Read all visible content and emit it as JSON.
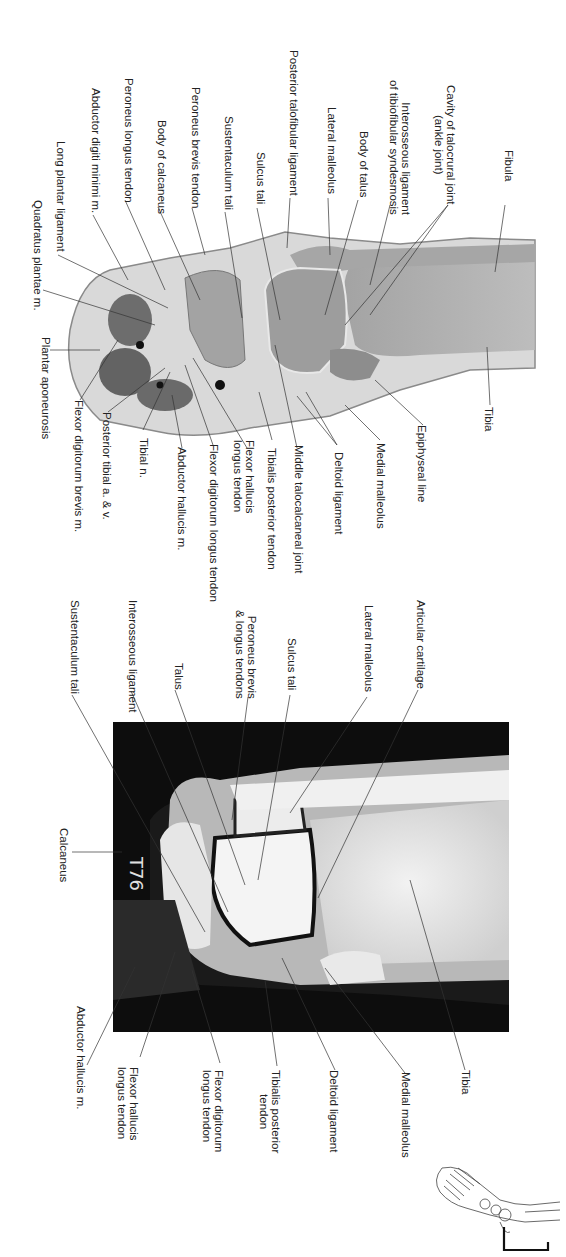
{
  "page": {
    "orientation": "rotated-90",
    "figures": [
      {
        "id": "cadaver-section",
        "type": "coronal anatomical section (ankle)",
        "labels": [
          {
            "text": "Fibula"
          },
          {
            "text": "Cavity of talocrural joint\n(ankle joint)"
          },
          {
            "text": "Interosseous ligament\nof tibiofibular syndesmosis"
          },
          {
            "text": "Body of talus"
          },
          {
            "text": "Lateral malleolus"
          },
          {
            "text": "Posterior talofibular ligament"
          },
          {
            "text": "Sulcus tali"
          },
          {
            "text": "Sustentaculum tali"
          },
          {
            "text": "Peroneus brevis tendon"
          },
          {
            "text": "Body of calcaneus"
          },
          {
            "text": "Peroneus longus tendon"
          },
          {
            "text": "Abductor digiti minimi m."
          },
          {
            "text": "Long plantar ligament"
          },
          {
            "text": "Quadratus plantae m."
          },
          {
            "text": "Plantar aponeurosis"
          },
          {
            "text": "Flexor digitorum brevis m."
          },
          {
            "text": "Posterior tibial a. & v."
          },
          {
            "text": "Tibial n."
          },
          {
            "text": "Abductor hallucis m."
          },
          {
            "text": "Flexor digitorum longus tendon"
          },
          {
            "text": "Flexor hallucis\nlongus tendon"
          },
          {
            "text": "Tibialis posterior tendon"
          },
          {
            "text": "Middle talocalcaneal joint"
          },
          {
            "text": "Deltoid ligament"
          },
          {
            "text": "Medial malleolus"
          },
          {
            "text": "Epiphyseal line"
          },
          {
            "text": "Tibia"
          }
        ]
      },
      {
        "id": "mri-section",
        "type": "coronal MRI (ankle)",
        "overlay_text": "T76",
        "labels": [
          {
            "text": "Articular cartilage"
          },
          {
            "text": "Lateral malleolus"
          },
          {
            "text": "Sulcus tali"
          },
          {
            "text": "Peroneus brevis\n& longus tendons"
          },
          {
            "text": "Talus"
          },
          {
            "text": "Interosseous ligament"
          },
          {
            "text": "Sustentaculum tali"
          },
          {
            "text": "Calcaneus"
          },
          {
            "text": "Abductor hallucis m."
          },
          {
            "text": "Flexor hallucis\nlongus tendon"
          },
          {
            "text": "Flexor digitorum\nlongus tendon"
          },
          {
            "text": "Tibialis posterior\ntendon"
          },
          {
            "text": "Deltoid ligament"
          },
          {
            "text": "Medial malleolus"
          },
          {
            "text": "Tibia"
          }
        ]
      }
    ],
    "orientation_icon": "foot-skeleton-icon"
  }
}
